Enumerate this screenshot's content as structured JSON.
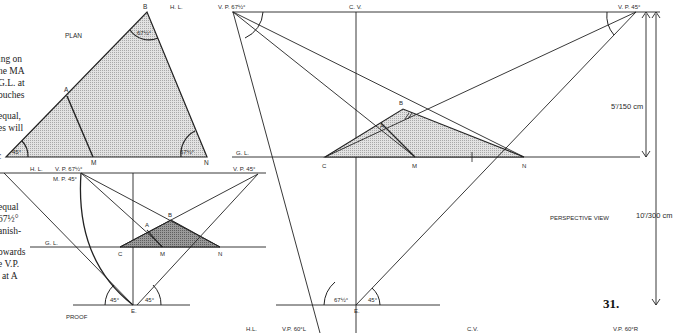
{
  "figure": {
    "number": "31.",
    "plan": {
      "title": "PLAN",
      "points": {
        "B": "B",
        "A": "A",
        "C": "C",
        "M": "M",
        "N": "N"
      },
      "angles": {
        "B": "67½°",
        "C": "45°",
        "N": "67½°"
      }
    },
    "proof": {
      "title": "PROOF",
      "hl": "H. L.",
      "gl": "G. L.",
      "vp_left": "V. P. 67½°",
      "mp": "M. P. 45°",
      "vp_right": "V. P. 45°",
      "points": {
        "M_top": "M",
        "N_top": "N",
        "A": "A",
        "B": "B",
        "C": "C",
        "M": "M",
        "N": "N",
        "E": "E."
      },
      "angles": {
        "left": "45°",
        "right": "45°"
      }
    },
    "perspective": {
      "title": "PERSPECTIVE VIEW",
      "hl": "H. L.",
      "gl": "G. L.",
      "vp_left": "V. P. 67½°",
      "cv": "C. V.",
      "vp_right": "V. P. 45°",
      "points": {
        "A": "A",
        "B": "B",
        "C": "C",
        "M": "M",
        "N": "N",
        "E": "E."
      },
      "angles": {
        "left": "67½°",
        "right": "45°"
      },
      "dimensions": {
        "eye_height": "5'/150 cm",
        "distance": "10'/300 cm"
      }
    },
    "bottom_strip": {
      "hl": "H.L.",
      "vp_left": "V.P. 60°L",
      "cv": "C.V.",
      "vp_right": "V.P. 60°R"
    },
    "body_text_fragments": [
      "ing on",
      "he MA",
      "G.L. at",
      "ouches",
      "equal,",
      "es  will",
      "c",
      "equal",
      "67½°",
      "anish-",
      "owards",
      "e  V.P.",
      "' at  A"
    ]
  }
}
